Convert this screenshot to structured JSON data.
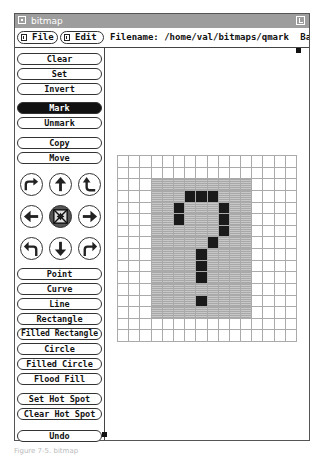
{
  "window": {
    "title": "bitmap",
    "icons": {
      "window_menu": "window-menu-icon",
      "pin": "pushpin-icon"
    }
  },
  "menubar": {
    "file_label": "File",
    "edit_label": "Edit",
    "filename_label": "Filename:",
    "filename_value": "/home/val/bitmaps/qmark",
    "basename_label": "Basen"
  },
  "commands": {
    "clear": "Clear",
    "set": "Set",
    "invert": "Invert",
    "mark": "Mark",
    "unmark": "Unmark",
    "copy": "Copy",
    "move": "Move",
    "point": "Point",
    "curve": "Curve",
    "line": "Line",
    "rectangle": "Rectangle",
    "filled_rectangle": "Filled Rectangle",
    "circle": "Circle",
    "filled_circle": "Filled Circle",
    "flood_fill": "Flood Fill",
    "set_hot_spot": "Set Hot Spot",
    "clear_hot_spot": "Clear Hot Spot",
    "undo": "Undo",
    "active": "Mark"
  },
  "arrow_pad": [
    [
      "flip-horizontal-icon",
      "shift-up-icon",
      "flip-vertical-icon"
    ],
    [
      "shift-left-icon",
      "fold-icon",
      "shift-right-icon"
    ],
    [
      "rotate-left-icon",
      "shift-down-icon",
      "rotate-right-icon"
    ]
  ],
  "bitmap": {
    "width": 16,
    "height": 16,
    "marked_region": {
      "col_start": 3,
      "col_end": 11,
      "row_start": 2,
      "row_end": 13
    },
    "set_pixels": [
      [
        3,
        6
      ],
      [
        3,
        7
      ],
      [
        3,
        8
      ],
      [
        4,
        5
      ],
      [
        4,
        9
      ],
      [
        5,
        5
      ],
      [
        5,
        9
      ],
      [
        6,
        9
      ],
      [
        7,
        8
      ],
      [
        8,
        7
      ],
      [
        9,
        7
      ],
      [
        10,
        7
      ],
      [
        12,
        7
      ]
    ]
  },
  "caption": "Figure 7-5. bitmap"
}
